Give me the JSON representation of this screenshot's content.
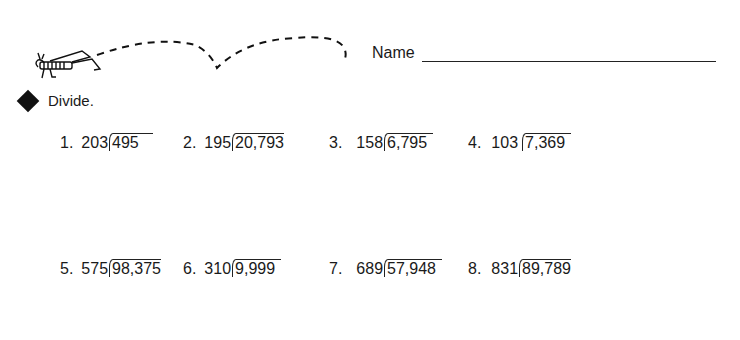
{
  "header": {
    "name_label": "Name",
    "decoration_icon": "grasshopper-icon"
  },
  "instruction": {
    "bullet_icon": "diamond-icon",
    "text": "Divide."
  },
  "problems": [
    {
      "number": "1.",
      "divisor": "203",
      "dividend": "495"
    },
    {
      "number": "2.",
      "divisor": "195",
      "dividend": "20,793"
    },
    {
      "number": "3.",
      "divisor": "158",
      "dividend": "6,795"
    },
    {
      "number": "4.",
      "divisor": "103",
      "dividend": "7,369"
    },
    {
      "number": "5.",
      "divisor": "575",
      "dividend": "98,375"
    },
    {
      "number": "6.",
      "divisor": "310",
      "dividend": "9,999"
    },
    {
      "number": "7.",
      "divisor": "689",
      "dividend": "57,948"
    },
    {
      "number": "8.",
      "divisor": "831",
      "dividend": "89,789"
    }
  ]
}
